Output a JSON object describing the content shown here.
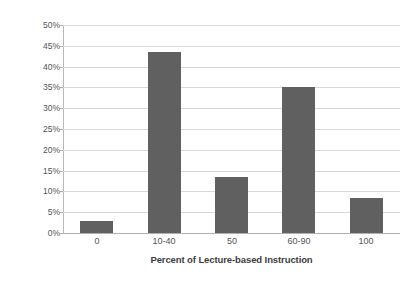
{
  "chart_data": {
    "type": "bar",
    "title": "",
    "xlabel": "Percent of Lecture-based Instruction",
    "ylabel": "Percent of Respondents",
    "categories": [
      "0",
      "10-40",
      "50",
      "60-90",
      "100"
    ],
    "values": [
      3,
      43.5,
      13.5,
      35,
      8.5
    ],
    "value_labels": [
      "3%",
      "43.5%",
      "13.5%",
      "35%",
      "8.5%"
    ],
    "ylim": [
      0,
      50
    ],
    "ytick_labels": [
      "0%",
      "5%",
      "10%",
      "15%",
      "20%",
      "25%",
      "30%",
      "35%",
      "40%",
      "45%",
      "50%"
    ],
    "ytick_values": [
      0,
      5,
      10,
      15,
      20,
      25,
      30,
      35,
      40,
      45,
      50
    ],
    "grid": true,
    "legend": false,
    "legend_position": "none",
    "series": [
      {
        "name": "Percent of Respondents",
        "color": "#606060",
        "values": [
          3,
          43.5,
          13.5,
          35,
          8.5
        ]
      }
    ],
    "colors": {
      "bar_fill": "#606060",
      "gridline": "#d8d8d8",
      "axis_line": "#b0b0b0",
      "tick_text": "#555555",
      "title_text": "#3d3d3d",
      "background": "#ffffff"
    }
  }
}
